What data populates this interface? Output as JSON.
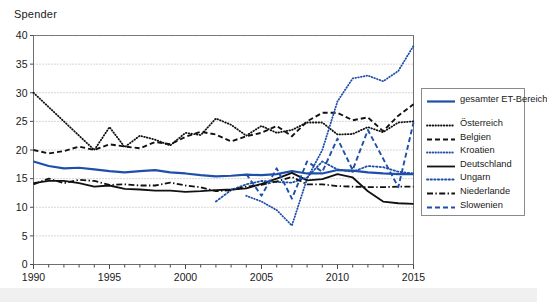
{
  "axis_title": "Spender",
  "legend": {
    "items": [
      {
        "label": "gesamter ET-Bereich",
        "key": "solid-thick-blue",
        "color": "#1F4FA8"
      },
      {
        "label": "Österreich",
        "key": "fine-dotted-black",
        "color": "#111111"
      },
      {
        "label": "Belgien",
        "key": "dashed-black",
        "color": "#111111"
      },
      {
        "label": "Kroatien",
        "key": "fine-dotted-blue",
        "color": "#1F4FA8"
      },
      {
        "label": "Deutschland",
        "key": "solid-black",
        "color": "#111111"
      },
      {
        "label": "Ungarn",
        "key": "dotted-blue",
        "color": "#1F4FA8"
      },
      {
        "label": "Niederlande",
        "key": "dash-dot-black",
        "color": "#111111"
      },
      {
        "label": "Slowenien",
        "key": "dashed-blue",
        "color": "#1F4FA8"
      }
    ]
  },
  "chart_data": {
    "type": "line",
    "title": "",
    "xlabel": "",
    "ylabel": "Spender",
    "xlim": [
      1990,
      2015
    ],
    "ylim": [
      0,
      40
    ],
    "ytick_step": 5,
    "yticks": [
      0,
      5,
      10,
      15,
      20,
      25,
      30,
      35,
      40
    ],
    "xticks_labeled": [
      1990,
      1995,
      2000,
      2005,
      2010,
      2015
    ],
    "grid": "horizontal-dotted",
    "legend_position": "right-outside",
    "x": [
      1990,
      1991,
      1992,
      1993,
      1994,
      1995,
      1996,
      1997,
      1998,
      1999,
      2000,
      2001,
      2002,
      2003,
      2004,
      2005,
      2006,
      2007,
      2008,
      2009,
      2010,
      2011,
      2012,
      2013,
      2014,
      2015
    ],
    "series": [
      {
        "name": "gesamter ET-Bereich",
        "color": "#1F4FA8",
        "style": "solid-thick",
        "values": [
          18.0,
          17.2,
          16.8,
          16.9,
          16.6,
          16.3,
          16.1,
          16.3,
          16.5,
          16.1,
          15.9,
          15.6,
          15.4,
          15.5,
          15.7,
          15.6,
          15.8,
          16.3,
          15.9,
          15.9,
          16.5,
          16.4,
          16.1,
          15.9,
          15.8,
          15.8
        ]
      },
      {
        "name": "Österreich",
        "color": "#111111",
        "style": "fine-dotted",
        "values": [
          30.0,
          27.5,
          25.0,
          22.5,
          20.0,
          24.0,
          20.5,
          22.5,
          21.8,
          20.8,
          23.0,
          22.6,
          25.5,
          24.4,
          22.5,
          24.2,
          23.0,
          23.5,
          24.8,
          24.8,
          22.7,
          22.8,
          24.0,
          23.1,
          24.8,
          25.0
        ]
      },
      {
        "name": "Belgien",
        "color": "#111111",
        "style": "dashed",
        "values": [
          20.0,
          19.4,
          19.8,
          20.6,
          20.0,
          21.0,
          20.6,
          20.3,
          21.4,
          21.0,
          22.3,
          23.2,
          22.7,
          21.5,
          22.4,
          23.0,
          24.2,
          22.4,
          25.0,
          26.5,
          26.5,
          25.2,
          25.7,
          23.3,
          26.0,
          28.0
        ]
      },
      {
        "name": "Kroatien",
        "color": "#1F4FA8",
        "style": "fine-dotted",
        "values": [
          null,
          null,
          null,
          null,
          null,
          null,
          null,
          null,
          null,
          null,
          null,
          null,
          null,
          null,
          12.0,
          11.0,
          9.5,
          6.8,
          15.0,
          20.0,
          28.5,
          32.5,
          33.0,
          32.0,
          33.8,
          38.2
        ]
      },
      {
        "name": "Deutschland",
        "color": "#111111",
        "style": "solid",
        "values": [
          14.2,
          14.6,
          14.6,
          14.2,
          13.6,
          13.8,
          13.2,
          13.1,
          12.9,
          12.9,
          12.7,
          12.8,
          13.0,
          13.1,
          13.3,
          14.1,
          15.0,
          16.0,
          14.7,
          14.9,
          15.8,
          15.2,
          12.8,
          11.0,
          10.7,
          10.6
        ]
      },
      {
        "name": "Ungarn",
        "color": "#1F4FA8",
        "style": "dotted",
        "values": [
          null,
          null,
          null,
          null,
          null,
          null,
          null,
          null,
          null,
          null,
          null,
          null,
          11.0,
          13.0,
          14.0,
          14.6,
          14.4,
          14.3,
          15.2,
          18.0,
          16.6,
          16.2,
          17.2,
          17.0,
          16.2,
          15.9
        ]
      },
      {
        "name": "Niederlande",
        "color": "#111111",
        "style": "dash-dot",
        "values": [
          14.0,
          15.0,
          14.2,
          14.8,
          14.6,
          13.9,
          14.0,
          13.8,
          13.8,
          14.3,
          13.8,
          13.5,
          12.8,
          13.0,
          13.6,
          13.9,
          14.5,
          15.3,
          14.0,
          14.0,
          13.7,
          13.6,
          13.5,
          13.5,
          13.6,
          13.6
        ]
      },
      {
        "name": "Slowenien",
        "color": "#1F4FA8",
        "style": "dashed",
        "values": [
          null,
          null,
          null,
          null,
          null,
          null,
          null,
          null,
          null,
          null,
          null,
          null,
          null,
          null,
          15.8,
          12.0,
          16.8,
          11.5,
          18.0,
          16.2,
          22.0,
          16.5,
          23.5,
          18.5,
          13.5,
          24.8
        ]
      }
    ]
  }
}
